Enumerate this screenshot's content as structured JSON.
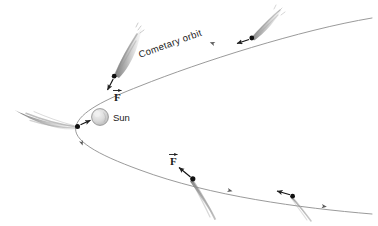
{
  "figure": {
    "background_color": "#ffffff",
    "width": 378,
    "height": 226
  },
  "labels": {
    "orbit": "Cometary orbit",
    "sun": "Sun",
    "force_upper": "F",
    "force_lower": "F"
  },
  "colors": {
    "orbit_line": "#8a8a8a",
    "comet_nucleus": "#111111",
    "comet_tail": "#8c8c8c",
    "comet_tail_light": "#b9b9b9",
    "sun_fill": "#dedede",
    "sun_stroke": "#8f8f8f",
    "arrow": "#111111",
    "text": "#1a1a1a"
  },
  "sun": {
    "cx": 100,
    "cy": 117,
    "r": 8.5
  },
  "orbit": {
    "type": "hyperbolic",
    "path": "M 372,18 C 300,30 200,62 140,86 C 104,100 80,112 76,126 C 72,140 96,154 140,170 C 210,196 300,208 372,214",
    "direction_arrows": [
      {
        "x": 86,
        "y": 143,
        "angle": 62
      },
      {
        "x": 216,
        "y": 44,
        "angle": -22
      },
      {
        "x": 232,
        "y": 186,
        "angle": 14
      },
      {
        "x": 326,
        "y": 203,
        "angle": 8
      }
    ]
  },
  "comets": [
    {
      "name": "comet-perihelion",
      "nucleus_x": 78,
      "nucleus_y": 126,
      "tail_angle": 190,
      "tail_length": 62,
      "tail_spread": 15,
      "force_arrow_to_x": 92,
      "force_arrow_to_y": 120,
      "force_label": null
    },
    {
      "name": "comet-inbound-upper",
      "nucleus_x": 114,
      "nucleus_y": 76,
      "tail_angle": 300,
      "tail_length": 58,
      "tail_spread": 11,
      "force_arrow_to_x": 106,
      "force_arrow_to_y": 92,
      "force_label": "F",
      "force_label_x": 117,
      "force_label_y": 100
    },
    {
      "name": "comet-outbound-upper",
      "nucleus_x": 252,
      "nucleus_y": 38,
      "tail_angle": 312,
      "tail_length": 40,
      "tail_spread": 9,
      "force_arrow_to_x": 232,
      "force_arrow_to_y": 44,
      "force_label": null
    },
    {
      "name": "comet-outbound-lower",
      "nucleus_x": 193,
      "nucleus_y": 179,
      "tail_angle": 58,
      "tail_length": 56,
      "tail_spread": 10,
      "force_arrow_to_x": 174,
      "force_arrow_to_y": 166,
      "force_label": "F",
      "force_label_x": 173,
      "force_label_y": 160
    },
    {
      "name": "comet-far-lower",
      "nucleus_x": 293,
      "nucleus_y": 196,
      "tail_angle": 42,
      "tail_length": 36,
      "tail_spread": 8,
      "force_arrow_to_x": 272,
      "force_arrow_to_y": 190,
      "force_label": null
    }
  ]
}
